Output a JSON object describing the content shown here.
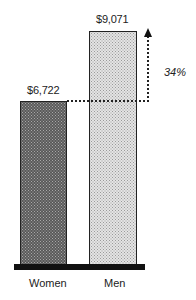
{
  "chart_data": {
    "type": "bar",
    "title": "",
    "xlabel": "",
    "ylabel": "",
    "categories": [
      "Women",
      "Men"
    ],
    "values": [
      6722,
      9071
    ],
    "value_labels": [
      "$6,722",
      "$9,071"
    ],
    "annotations": [
      {
        "text": "34%",
        "description": "Dotted arrow from top of Women bar up to top of Men bar indicating a 34% difference"
      }
    ],
    "grid": false,
    "legend": null
  },
  "labels": {
    "women_value": "$6,722",
    "men_value": "$9,071",
    "women_category": "Women",
    "men_category": "Men",
    "difference_pct": "34%"
  }
}
